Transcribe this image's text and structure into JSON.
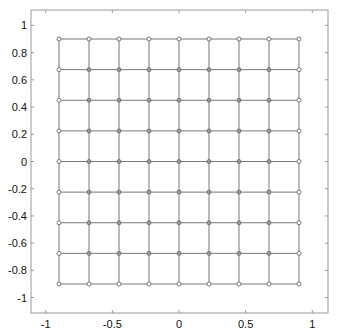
{
  "chart_data": {
    "type": "scatter",
    "title": "",
    "xlabel": "",
    "ylabel": "",
    "xlim": [
      -1.1,
      1.1
    ],
    "ylim": [
      -1.1,
      1.1
    ],
    "grid": false,
    "legend": null,
    "xticks": [
      -1,
      -0.5,
      0,
      0.5,
      1
    ],
    "xtick_labels": [
      "-1",
      "-0.5",
      "0",
      "0.5",
      "1"
    ],
    "yticks": [
      -1,
      -0.8,
      -0.6,
      -0.4,
      -0.2,
      0,
      0.2,
      0.4,
      0.6,
      0.8,
      1
    ],
    "ytick_labels": [
      "-1",
      "-0.8",
      "-0.6",
      "-0.4",
      "-0.2",
      "0",
      "0.2",
      "0.4",
      "0.6",
      "0.8",
      "1"
    ],
    "mesh": {
      "description": "9x9 uniform grid of nodes connected by horizontal and vertical lines",
      "x": [
        -0.9,
        -0.675,
        -0.45,
        -0.225,
        0,
        0.225,
        0.45,
        0.675,
        0.9
      ],
      "y": [
        -0.9,
        -0.675,
        -0.45,
        -0.225,
        0,
        0.225,
        0.45,
        0.675,
        0.9
      ],
      "marker": "circle",
      "line_color": "#777777",
      "marker_color": "#777777"
    }
  },
  "layout": {
    "frame": {
      "left": 31,
      "top": 10,
      "right": 328,
      "bottom": 313
    },
    "x_origin_px": 179,
    "x_scale_px": 133.3,
    "y_origin_px": 161.5,
    "y_scale_px": 136.1
  }
}
